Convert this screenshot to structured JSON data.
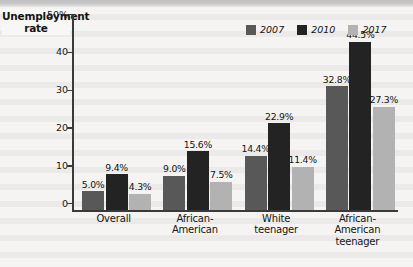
{
  "chart_data": {
    "type": "bar",
    "title": "",
    "xlabel": "",
    "ylabel": "Unemployment rate",
    "ylim": [
      0,
      50
    ],
    "ytick_values": [
      0,
      10,
      20,
      30,
      40,
      50
    ],
    "ytick_labels": [
      "0",
      "10",
      "20",
      "30",
      "40",
      "50%"
    ],
    "grid": false,
    "legend_position": "top-right",
    "categories": [
      "Overall",
      "African-American",
      "White teenager",
      "African-American teenager"
    ],
    "category_lines": [
      [
        "Overall"
      ],
      [
        "African-",
        "American"
      ],
      [
        "White",
        "teenager"
      ],
      [
        "African-",
        "American",
        "teenager"
      ]
    ],
    "series": [
      {
        "name": "2007",
        "color": "#585858",
        "values": [
          5.0,
          9.0,
          14.4,
          32.8
        ],
        "labels": [
          "5.0%",
          "9.0%",
          "14.4%",
          "32.8%"
        ]
      },
      {
        "name": "2010",
        "color": "#232323",
        "values": [
          9.4,
          15.6,
          22.9,
          44.5
        ],
        "labels": [
          "9.4%",
          "15.6%",
          "22.9%",
          "44.5%"
        ]
      },
      {
        "name": "2017",
        "color": "#b2b2b2",
        "values": [
          4.3,
          7.5,
          11.4,
          27.3
        ],
        "labels": [
          "4.3%",
          "7.5%",
          "11.4%",
          "27.3%"
        ]
      }
    ]
  },
  "legend": {
    "items": [
      {
        "label": "2007"
      },
      {
        "label": "2010"
      },
      {
        "label": "2017"
      }
    ]
  },
  "axis": {
    "y_title": "Unemployment rate"
  }
}
